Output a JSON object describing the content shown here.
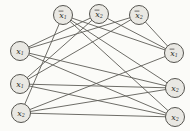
{
  "figure": {
    "name": "3sat-clique-reduction-graph",
    "background": "#fbfbf8",
    "node_fill": "#e9e8e3",
    "node_stroke": "#55544f",
    "edge_color": "#5d5c57",
    "node_radius": 9.5,
    "nodes": [
      {
        "id": "a1",
        "base": "x",
        "sub": "1",
        "bar": true,
        "label": "x̄₁",
        "x": 63,
        "y": 15
      },
      {
        "id": "a2",
        "base": "x",
        "sub": "2",
        "bar": true,
        "label": "x̄₂",
        "x": 99,
        "y": 14
      },
      {
        "id": "a3",
        "base": "x",
        "sub": "2",
        "bar": true,
        "label": "x̄₂",
        "x": 139,
        "y": 15
      },
      {
        "id": "b1",
        "base": "x",
        "sub": "1",
        "bar": false,
        "label": "x₁",
        "x": 20,
        "y": 51
      },
      {
        "id": "b2",
        "base": "x",
        "sub": "1",
        "bar": false,
        "label": "x₁",
        "x": 20,
        "y": 84
      },
      {
        "id": "b3",
        "base": "x",
        "sub": "2",
        "bar": false,
        "label": "x₂",
        "x": 21,
        "y": 113
      },
      {
        "id": "c1",
        "base": "x",
        "sub": "1",
        "bar": true,
        "label": "x̄₁",
        "x": 174,
        "y": 53
      },
      {
        "id": "c2",
        "base": "x",
        "sub": "2",
        "bar": false,
        "label": "x₂",
        "x": 175,
        "y": 88
      },
      {
        "id": "c3",
        "base": "x",
        "sub": "2",
        "bar": false,
        "label": "x₂",
        "x": 175,
        "y": 117
      }
    ],
    "edges": [
      [
        "a1",
        "b3"
      ],
      [
        "a1",
        "c1"
      ],
      [
        "a1",
        "c2"
      ],
      [
        "a1",
        "c3"
      ],
      [
        "a2",
        "b1"
      ],
      [
        "a2",
        "b2"
      ],
      [
        "a2",
        "c1"
      ],
      [
        "a3",
        "b1"
      ],
      [
        "a3",
        "b2"
      ],
      [
        "a3",
        "c1"
      ],
      [
        "b1",
        "c2"
      ],
      [
        "b1",
        "c3"
      ],
      [
        "b2",
        "c2"
      ],
      [
        "b2",
        "c3"
      ],
      [
        "b3",
        "c1"
      ],
      [
        "b3",
        "c2"
      ],
      [
        "b3",
        "c3"
      ]
    ]
  }
}
